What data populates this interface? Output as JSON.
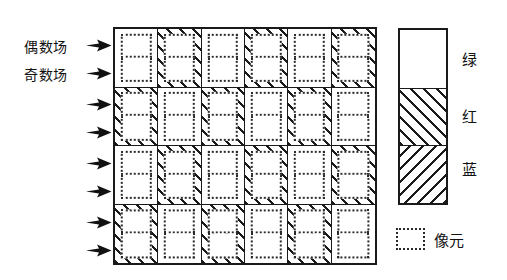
{
  "diagram": {
    "field_labels": [
      {
        "id": "even-field",
        "text": "偶数场"
      },
      {
        "id": "odd-field",
        "text": "奇数场"
      }
    ],
    "scan_arrows": {
      "count": 8,
      "icon": "arrow-right-icon",
      "tops": [
        39,
        67,
        98,
        126,
        157,
        185,
        216,
        244
      ]
    },
    "grid": {
      "columns": 6,
      "rows": 4,
      "cell_content": "pixel-element-pair",
      "pattern_note": "checkerboard: white = 绿, hatched = 红/蓝",
      "rows_data": [
        [
          "white",
          "hatch",
          "white",
          "hatch",
          "white",
          "hatch"
        ],
        [
          "hatch",
          "white",
          "hatch",
          "white",
          "hatch",
          "white"
        ],
        [
          "white",
          "hatch",
          "white",
          "hatch",
          "white",
          "hatch"
        ],
        [
          "hatch",
          "white",
          "hatch",
          "white",
          "hatch",
          "white"
        ]
      ]
    },
    "legend": {
      "swatches": [
        {
          "id": "green",
          "fill": "white",
          "label": "绿"
        },
        {
          "id": "red",
          "fill": "hatch-fwd",
          "label": "红"
        },
        {
          "id": "blue",
          "fill": "hatch-back",
          "label": "蓝"
        }
      ],
      "pixel_key": {
        "swatch": "dotted-box",
        "label": "像元"
      }
    },
    "colors": {
      "line": "#1a1a1a",
      "dotted": "#2a2a2a",
      "background": "#ffffff"
    }
  }
}
